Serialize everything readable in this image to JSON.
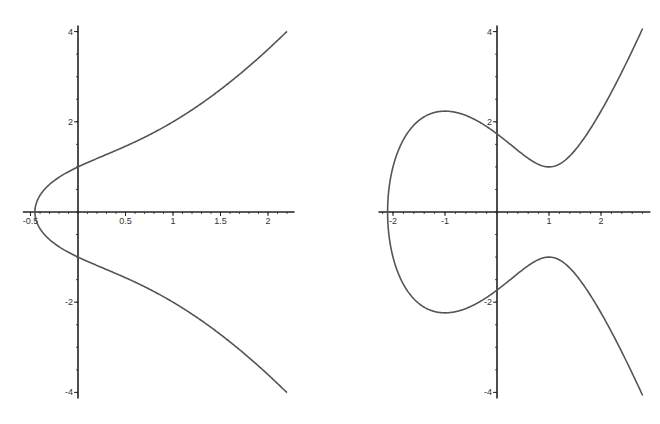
{
  "chart_data": [
    {
      "type": "line",
      "title": "",
      "equation": "y^2 = x^3 + 2x + 1",
      "xlabel": "",
      "ylabel": "",
      "xlim": [
        -0.5,
        2.2
      ],
      "ylim": [
        -4,
        4
      ],
      "grid": false,
      "x_ticks": [
        "-0.5",
        "0.5",
        "1",
        "1.5",
        "2"
      ],
      "y_ticks": [
        "4",
        "2",
        "-2",
        "-4"
      ],
      "series": [
        {
          "name": "upper branch",
          "x": [
            -0.45,
            -0.4,
            -0.3,
            0,
            0.5,
            1,
            1.5,
            2,
            2.2
          ],
          "y": [
            0,
            0.39,
            0.63,
            1.0,
            1.5,
            2.0,
            2.65,
            3.6,
            4.0
          ]
        },
        {
          "name": "lower branch",
          "x": [
            -0.45,
            -0.4,
            -0.3,
            0,
            0.5,
            1,
            1.5,
            2,
            2.2
          ],
          "y": [
            0,
            -0.39,
            -0.63,
            -1.0,
            -1.5,
            -2.0,
            -2.65,
            -3.6,
            -4.0
          ]
        }
      ]
    },
    {
      "type": "line",
      "title": "",
      "equation": "y^2 = x^3 - 3x + 3",
      "xlabel": "",
      "ylabel": "",
      "xlim": [
        -2.1,
        2.8
      ],
      "ylim": [
        -4,
        4
      ],
      "grid": false,
      "x_ticks": [
        "-2",
        "-1",
        "1",
        "2"
      ],
      "y_ticks": [
        "4",
        "2",
        "-2",
        "-4"
      ],
      "series": [
        {
          "name": "upper branch",
          "x": [
            -2.1,
            -2,
            -1.5,
            -1,
            0,
            1,
            2,
            2.8
          ],
          "y": [
            0,
            1.0,
            2.1,
            2.24,
            1.73,
            1.0,
            2.24,
            4.06
          ]
        },
        {
          "name": "lower branch",
          "x": [
            -2.1,
            -2,
            -1.5,
            -1,
            0,
            1,
            2,
            2.8
          ],
          "y": [
            0,
            -1.0,
            -2.1,
            -2.24,
            -1.73,
            -1.0,
            -2.24,
            -4.06
          ]
        }
      ]
    }
  ],
  "left_plot": {
    "x_tick_labels": [
      "-0.5",
      "0.5",
      "1",
      "1.5",
      "2"
    ],
    "y_tick_labels": [
      "4",
      "2",
      "-2",
      "-4"
    ]
  },
  "right_plot": {
    "x_tick_labels": [
      "-2",
      "-1",
      "1",
      "2"
    ],
    "y_tick_labels": [
      "4",
      "2",
      "-2",
      "-4"
    ]
  },
  "colors": {
    "curve": "#555555",
    "axis": "#222222"
  }
}
